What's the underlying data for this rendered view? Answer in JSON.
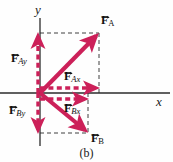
{
  "figure": {
    "caption": "(b)",
    "background_color": "#fefefe",
    "width": 173,
    "height": 162
  },
  "axes": {
    "x_label": "x",
    "y_label": "y",
    "axis_color": "#2b2b2b",
    "origin": {
      "x": 40,
      "y": 93
    },
    "x_axis": {
      "x1": 0,
      "y1": 93,
      "x2": 170,
      "y2": 93
    },
    "y_axis": {
      "x1": 40,
      "y1": 18,
      "x2": 40,
      "y2": 146
    }
  },
  "vectors": {
    "accent_color": "#cc2059",
    "construction_color": "#2b2b2b",
    "items": [
      {
        "id": "F_A",
        "symbol": "F",
        "subscript": "A",
        "style": "solid",
        "label_x": 101,
        "label_y": 14,
        "x1": 40,
        "y1": 93,
        "x2": 99,
        "y2": 33
      },
      {
        "id": "F_Ay",
        "symbol": "F",
        "subscript": "Ay",
        "style": "dashed",
        "label_x": 11,
        "label_y": 52,
        "x1": 38,
        "y1": 93,
        "x2": 38,
        "y2": 33
      },
      {
        "id": "F_Ax",
        "symbol": "F",
        "subscript": "Ax",
        "style": "dashed",
        "label_x": 64,
        "label_y": 70,
        "x1": 40,
        "y1": 88,
        "x2": 99,
        "y2": 88
      },
      {
        "id": "F_Bx",
        "symbol": "F",
        "subscript": "Bx",
        "style": "dashed",
        "label_x": 64,
        "label_y": 102,
        "x1": 40,
        "y1": 99,
        "x2": 88,
        "y2": 99
      },
      {
        "id": "F_By",
        "symbol": "F",
        "subscript": "By",
        "style": "dashed",
        "label_x": 9,
        "label_y": 104,
        "x1": 38,
        "y1": 93,
        "x2": 38,
        "y2": 133
      },
      {
        "id": "F_B",
        "symbol": "F",
        "subscript": "B",
        "style": "solid",
        "label_x": 91,
        "label_y": 132,
        "x1": 40,
        "y1": 93,
        "x2": 88,
        "y2": 133
      }
    ]
  },
  "construction_lines": [
    {
      "id": "top-horizontal",
      "x1": 40,
      "y1": 33,
      "x2": 99,
      "y2": 33
    },
    {
      "id": "right-vertical-upper",
      "x1": 99,
      "y1": 33,
      "x2": 99,
      "y2": 93
    },
    {
      "id": "right-vertical-lower",
      "x1": 88,
      "y1": 93,
      "x2": 88,
      "y2": 133
    },
    {
      "id": "bottom-horizontal",
      "x1": 40,
      "y1": 133,
      "x2": 88,
      "y2": 133
    }
  ]
}
